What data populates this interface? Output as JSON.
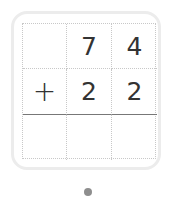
{
  "problem": {
    "rows": [
      [
        "",
        "7",
        "4"
      ],
      [
        "+",
        "2",
        "2"
      ],
      [
        "",
        "",
        ""
      ]
    ]
  },
  "pagination": {
    "dots": 1,
    "active_index": 0,
    "active_color": "#8e8e8e"
  }
}
